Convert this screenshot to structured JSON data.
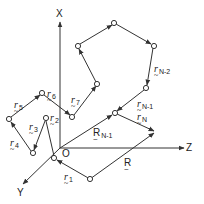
{
  "diagram": {
    "type": "polymer-chain-vector-diagram",
    "axes": {
      "x_label": "X",
      "y_label": "Y",
      "z_label": "Z",
      "origin_label": "O"
    },
    "bond_labels": {
      "r1": {
        "base": "r",
        "sub": "1"
      },
      "r2": {
        "base": "r",
        "sub": "2"
      },
      "r3": {
        "base": "r",
        "sub": "3"
      },
      "r4": {
        "base": "r",
        "sub": "4"
      },
      "r5": {
        "base": "r",
        "sub": "5"
      },
      "r6": {
        "base": "r",
        "sub": "6"
      },
      "r7": {
        "base": "r",
        "sub": "7"
      },
      "rN2": {
        "base": "r",
        "sub": "N-2"
      },
      "rN1": {
        "base": "r",
        "sub": "N-1"
      },
      "rN": {
        "base": "r",
        "sub": "N"
      }
    },
    "position_labels": {
      "R": {
        "base": "R",
        "sub": ""
      },
      "RN1": {
        "base": "R",
        "sub": "N-1"
      }
    },
    "tilde": "~",
    "colors": {
      "line": "#333333",
      "background": "#ffffff"
    }
  }
}
